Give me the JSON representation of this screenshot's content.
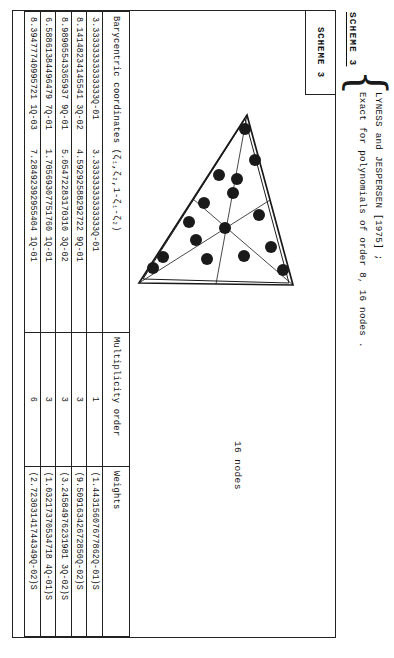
{
  "document": {
    "scheme_heading": "SCHEME 3",
    "scheme_box_label": "SCHEME 3",
    "citation_line1": "LYNESS and JESPERSEN [1975] ;",
    "citation_line2": "Exact for polynomials of order 8, 16 nodes  .",
    "nodes_caption": "16 nodes",
    "brace_glyph": "{"
  },
  "table": {
    "headers": {
      "coordinates": "Barycentric coordinates (ζ₁,ζ₂,1-ζ₁-ζ₂)",
      "multiplicity": "Multiplicity order",
      "weights": "Weights"
    },
    "rows": [
      {
        "coord1": "3.33333333333333Q-01",
        "coord2": "3.33333333333333Q-01",
        "multiplicity": "1",
        "weight": "(1.44315607677862Q-01)S"
      },
      {
        "coord1": "8.14148234145541 3Q-02",
        "coord2": "4.59292588292722 9Q-01",
        "multiplicity": "3",
        "weight": "(9.50916342672850Q-02)S"
      },
      {
        "coord1": "8.98905543365937 9Q-01",
        "coord2": "5.05472283170310 3Q-02",
        "multiplicity": "3",
        "weight": "(3.24584976231981 3Q-02)S"
      },
      {
        "coord1": "6.58861384496479 7Q-01",
        "coord2": "1.70569307751760 1Q-01",
        "multiplicity": "3",
        "weight": "(1.03217370534718 4Q-01)S"
      },
      {
        "coord1": "8.39477740995721 1Q-03",
        "coord2": "7.28492392955404 1Q-01",
        "multiplicity": "6",
        "weight": "(2.72303141744349Q-02)S"
      }
    ]
  },
  "diagram": {
    "label": "triangle-quadrature-nodes",
    "node_count": 16,
    "nodes": [
      {
        "x": 22,
        "y": 84
      },
      {
        "x": 53,
        "y": 74
      },
      {
        "x": 72,
        "y": 92
      },
      {
        "x": 108,
        "y": 70
      },
      {
        "x": 121,
        "y": 104
      },
      {
        "x": 140,
        "y": 58
      },
      {
        "x": 149,
        "y": 85
      },
      {
        "x": 163,
        "y": 46
      },
      {
        "x": 152,
        "y": 122
      },
      {
        "x": 96,
        "y": 125
      },
      {
        "x": 115,
        "y": 140
      },
      {
        "x": 150,
        "y": 166
      },
      {
        "x": 161,
        "y": 176
      },
      {
        "x": 133,
        "y": 133
      },
      {
        "x": 86,
        "y": 96
      },
      {
        "x": 68,
        "y": 110
      }
    ]
  },
  "colors": {
    "ink": "#1a1a1a",
    "paper": "#ffffff",
    "rule": "#222222"
  }
}
